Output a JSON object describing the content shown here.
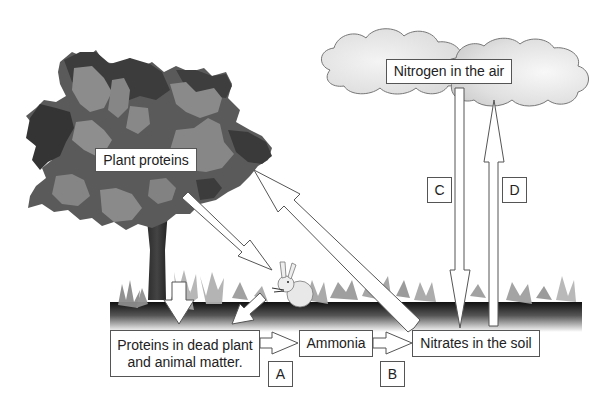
{
  "diagram": {
    "nodes": {
      "plant_proteins": "Plant proteins",
      "nitrogen_air": "Nitrogen in the air",
      "dead_matter": "Proteins in dead plant and animal matter.",
      "dead_matter_line1": "Proteins in dead plant",
      "dead_matter_line2": "and animal matter.",
      "ammonia": "Ammonia",
      "nitrates": "Nitrates in the soil"
    },
    "process_labels": {
      "A": "A",
      "B": "B",
      "C": "C",
      "D": "D"
    },
    "edges": [
      {
        "from": "Plant proteins",
        "to": "Proteins in dead plant and animal matter.",
        "label": ""
      },
      {
        "from": "Plant proteins",
        "to": "Rabbit (animal)",
        "label": ""
      },
      {
        "from": "Rabbit (animal)",
        "to": "Proteins in dead plant and animal matter.",
        "label": ""
      },
      {
        "from": "Nitrates in the soil",
        "to": "Plant proteins",
        "label": ""
      },
      {
        "from": "Proteins in dead plant and animal matter.",
        "to": "Ammonia",
        "label": "A"
      },
      {
        "from": "Ammonia",
        "to": "Nitrates in the soil",
        "label": "B"
      },
      {
        "from": "Nitrogen in the air",
        "to": "Nitrates in the soil",
        "label": "C"
      },
      {
        "from": "Nitrates in the soil",
        "to": "Nitrogen in the air",
        "label": "D"
      }
    ],
    "illustrations": [
      "tree",
      "clouds",
      "rabbit",
      "ground-with-plants"
    ],
    "colors": {
      "canopy_dark": "#3a3a3a",
      "canopy_mid": "#5e5e5e",
      "canopy_light": "#8a8a8a",
      "cloud_fill": "#e4e4e4",
      "soil_dark": "#1a1a1a",
      "plant_grey": "#9a9a9a",
      "outline": "#555555"
    }
  }
}
